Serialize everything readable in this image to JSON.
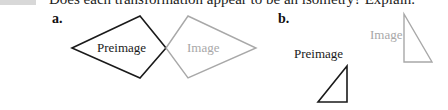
{
  "question": {
    "prompt": "Does each transformation appear to be an isometry? Explain."
  },
  "parts": [
    {
      "label": "a.",
      "preimage": {
        "label": "Preimage",
        "color": "#1a1a1a",
        "points": "72,48 140,16 166,48 140,78"
      },
      "image": {
        "label": "Image",
        "color": "#a8a8a8",
        "points": "166,48 188,16 256,48 188,78"
      }
    },
    {
      "label": "b.",
      "preimage": {
        "label": "Preimage",
        "color": "#1a1a1a",
        "points": "347,66 347,102 318,102"
      },
      "image": {
        "label": "Image",
        "color": "#a8a8a8",
        "points": "404,14 404,62 432,62"
      }
    }
  ]
}
